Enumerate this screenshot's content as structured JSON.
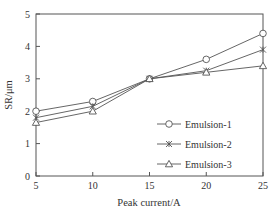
{
  "chart_data": {
    "type": "line",
    "title": "",
    "xlabel": "Peak current/A",
    "ylabel": "SR/μm",
    "x": [
      5,
      10,
      15,
      20,
      25
    ],
    "xticks": [
      "5",
      "10",
      "15",
      "20",
      "25"
    ],
    "yticks": [
      "0",
      "1",
      "2",
      "3",
      "4",
      "5"
    ],
    "xlim": [
      5,
      25
    ],
    "ylim": [
      0,
      5
    ],
    "grid": false,
    "legend_position": "lower right (inside)",
    "series": [
      {
        "name": "Emulsion-1",
        "marker": "circle",
        "values": [
          2.0,
          2.3,
          3.0,
          3.6,
          4.4
        ]
      },
      {
        "name": "Emulsion-2",
        "marker": "x-cross",
        "values": [
          1.8,
          2.15,
          3.0,
          3.25,
          3.9
        ]
      },
      {
        "name": "Emulsion-3",
        "marker": "triangle",
        "values": [
          1.65,
          2.0,
          3.0,
          3.2,
          3.4
        ]
      }
    ]
  }
}
